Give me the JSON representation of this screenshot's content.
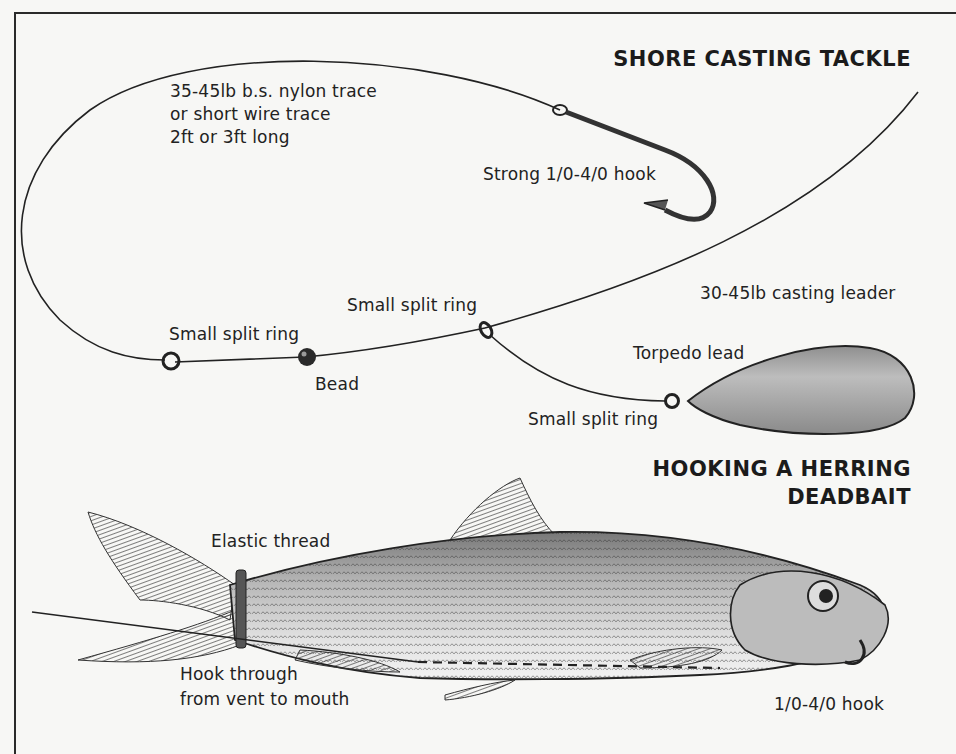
{
  "sections": {
    "tackle": {
      "title": "SHORE CASTING TACKLE",
      "labels": {
        "trace_line1": "35-45lb b.s. nylon trace",
        "trace_line2": "or short wire trace",
        "trace_line3": "2ft or 3ft long",
        "hook": "Strong 1/0-4/0 hook",
        "leader": "30-45lb casting leader",
        "split_ring_left": "Small split ring",
        "split_ring_middle": "Small split ring",
        "split_ring_lead": "Small split ring",
        "bead": "Bead",
        "lead": "Torpedo lead"
      }
    },
    "herring": {
      "title_line1": "HOOKING A HERRING",
      "title_line2": "DEADBAIT",
      "labels": {
        "thread": "Elastic thread",
        "hook_through_line1": "Hook through",
        "hook_through_line2": "from vent to mouth",
        "hook": "1/0-4/0 hook"
      }
    }
  },
  "colors": {
    "background": "#f7f7f5",
    "ink": "#1e1e1e",
    "lead_fill": "#a8a8a8",
    "fish_body": "#cfcfcf",
    "fin": "#6a6a6a"
  }
}
